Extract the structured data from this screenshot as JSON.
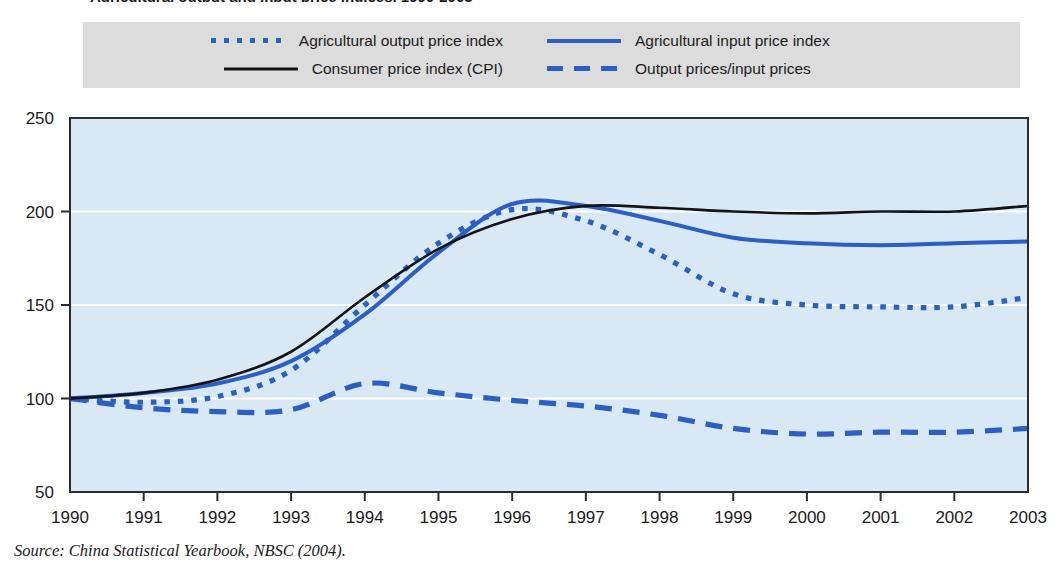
{
  "figure": {
    "title_partial": "Agricultural output and input price indices, 1990-2003",
    "source_prefix": "Source:",
    "source_text": "China Statistical Yearbook, NBSC (2004)."
  },
  "legend": {
    "background_color": "#dcdcdc",
    "items": [
      {
        "label": "Agricultural output price index",
        "style": "dotted",
        "color": "#2b5fc4",
        "swatch_name": "legend-swatch-dotted-blue"
      },
      {
        "label": "Agricultural input price index",
        "style": "solid",
        "color": "#2b5fc4",
        "swatch_name": "legend-swatch-solid-blue"
      },
      {
        "label": "Consumer price index (CPI)",
        "style": "solid",
        "color": "#141414",
        "swatch_name": "legend-swatch-solid-black"
      },
      {
        "label": "Output prices/input prices",
        "style": "dashed",
        "color": "#2b5fc4",
        "swatch_name": "legend-swatch-dashed-blue"
      }
    ]
  },
  "chart_data": {
    "type": "line",
    "title": "Agricultural output and input price indices, 1990-2003",
    "xlabel": "",
    "ylabel": "",
    "plot_background": "#d9e8f5",
    "grid": true,
    "grid_color": "#ffffff",
    "legend_position": "top",
    "xlim": [
      1990,
      2003
    ],
    "ylim": [
      50,
      250
    ],
    "x": [
      1990,
      1991,
      1992,
      1993,
      1994,
      1995,
      1996,
      1997,
      1998,
      1999,
      2000,
      2001,
      2002,
      2003
    ],
    "categories": [
      "1990",
      "1991",
      "1992",
      "1993",
      "1994",
      "1995",
      "1996",
      "1997",
      "1998",
      "1999",
      "2000",
      "2001",
      "2002",
      "2003"
    ],
    "yticks": [
      50,
      100,
      150,
      200,
      250
    ],
    "ytick_labels": [
      "50",
      "100",
      "150",
      "200",
      "250"
    ],
    "series": [
      {
        "name": "Agricultural output price index",
        "style": "dotted",
        "color": "#2b5fc4",
        "values": [
          100,
          98,
          101,
          115,
          150,
          183,
          201,
          195,
          177,
          156,
          150,
          149,
          149,
          154
        ]
      },
      {
        "name": "Agricultural input price index",
        "style": "solid",
        "color": "#2b5fc4",
        "values": [
          100,
          103,
          108,
          120,
          145,
          178,
          204,
          203,
          195,
          186,
          183,
          182,
          183,
          184
        ]
      },
      {
        "name": "Consumer price index (CPI)",
        "style": "solid",
        "color": "#141414",
        "values": [
          100,
          103,
          110,
          125,
          154,
          180,
          196,
          203,
          202,
          200,
          199,
          200,
          200,
          203
        ]
      },
      {
        "name": "Output prices/input prices",
        "style": "dashed",
        "color": "#2b5fc4",
        "values": [
          100,
          95,
          93,
          94,
          108,
          103,
          99,
          96,
          91,
          84,
          81,
          82,
          82,
          84
        ]
      }
    ]
  }
}
